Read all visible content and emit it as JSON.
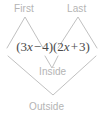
{
  "figure": {
    "type": "foil-multiplication-diagram",
    "alt": "FOIL diagram for the product (3x - 4)(2x + 3)"
  },
  "expression": {
    "full_text": "(3x − 4)(2x + 3)",
    "left_paren_1": "(",
    "term_1_coefficient": "3",
    "term_1_variable": "x",
    "operator_1": "−",
    "term_2": "4",
    "right_paren_1": ")",
    "left_paren_2": "(",
    "term_3_coefficient": "2",
    "term_3_variable": "x",
    "operator_2": "+",
    "term_4": "3",
    "right_paren_2": ")",
    "color": "#4a4a4a"
  },
  "labels": {
    "first": "First",
    "last": "Last",
    "inside": "Inside",
    "outside": "Outside",
    "color": "#b4b4b4"
  },
  "connectors": {
    "color": "#b9b9b9",
    "first_path": "M 7 48 L 25 17 L 43 48",
    "last_path": "M 58 48 L 78 17 L 97 48",
    "inside_path": "M 45 56 L 52 68 L 58 56",
    "outside_path": "M 8 56 L 53 95 L 96 56"
  }
}
